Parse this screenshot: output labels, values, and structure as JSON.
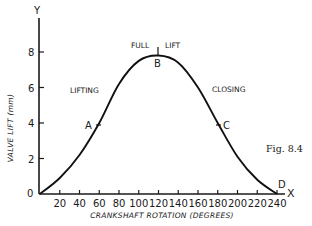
{
  "chart_data": {
    "type": "line",
    "title": "",
    "figure_label": "Fig. 8.4",
    "xlabel": "CRANKSHAFT ROTATION (DEGREES)",
    "ylabel": "VALVE LIFT (mm)",
    "x_axis_letter": "X",
    "y_axis_letter": "Y",
    "xlim": [
      0,
      250
    ],
    "ylim": [
      0,
      10
    ],
    "x_ticks": [
      20,
      40,
      60,
      80,
      100,
      120,
      140,
      160,
      180,
      200,
      220,
      240
    ],
    "y_ticks": [
      0,
      2,
      4,
      6,
      8
    ],
    "grid": false,
    "legend": null,
    "series": [
      {
        "name": "Valve lift",
        "x": [
          0,
          20,
          40,
          60,
          80,
          100,
          120,
          140,
          160,
          180,
          200,
          220,
          240
        ],
        "values": [
          0,
          0.9,
          2.2,
          4.0,
          6.2,
          7.5,
          7.8,
          7.4,
          6.0,
          4.0,
          2.1,
          0.8,
          0
        ]
      }
    ],
    "points": [
      {
        "label": "A",
        "x": 60,
        "y": 4.0
      },
      {
        "label": "B",
        "x": 120,
        "y": 7.8
      },
      {
        "label": "C",
        "x": 180,
        "y": 4.0
      },
      {
        "label": "D",
        "x": 240,
        "y": 0
      }
    ],
    "annotations": [
      {
        "text": "LIFTING",
        "near_x": 40,
        "near_y": 6
      },
      {
        "text": "FULL",
        "near_x": 108,
        "near_y": 8.6
      },
      {
        "text": "LIFT",
        "near_x": 132,
        "near_y": 8.6
      },
      {
        "text": "CLOSING",
        "near_x": 195,
        "near_y": 6
      }
    ]
  },
  "labels": {
    "y_letter": "Y",
    "x_letter": "X",
    "ylabel": "VALVE LIFT (mm)",
    "xlabel": "CRANKSHAFT ROTATION (DEGREES)",
    "origin": "0",
    "fig": "Fig. 8.4",
    "lifting": "LIFTING",
    "full": "FULL",
    "lift": "LIFT",
    "closing": "CLOSING",
    "pt_a": "A",
    "pt_b": "B",
    "pt_c": "C",
    "pt_d": "D",
    "y_ticks": [
      "2",
      "4",
      "6",
      "8"
    ],
    "x_ticks": [
      "20",
      "40",
      "60",
      "80",
      "100",
      "120",
      "140",
      "160",
      "180",
      "200",
      "220",
      "240"
    ]
  }
}
